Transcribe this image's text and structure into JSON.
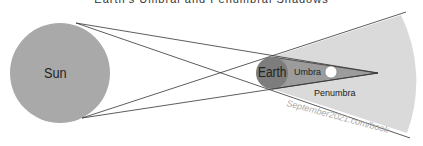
{
  "title": "Earth's Umbral and Penumbral Shadows",
  "labels": {
    "sun": "Sun",
    "earth": "Earth",
    "umbra": "Umbra",
    "penumbra": "Penumbra",
    "watermark": "September2021.com/book"
  },
  "colors": {
    "sun": "#a9a9a9",
    "earth": "#7d7d7d",
    "penumbra": "#d9d9d9",
    "umbra": "#9a9a9a",
    "moon": "#ffffff",
    "lines": "#333333"
  }
}
